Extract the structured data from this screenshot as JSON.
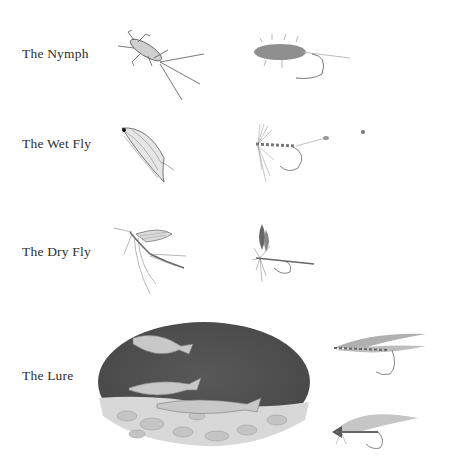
{
  "rows": [
    {
      "label": "The Nymph",
      "insect": "nymph-insect-illustration",
      "fly": "nymph-fly-illustration"
    },
    {
      "label": "The Wet Fly",
      "insect": "wet-fly-insect-illustration",
      "fly": "wet-fly-illustration"
    },
    {
      "label": "The Dry Fly",
      "insect": "mayfly-illustration",
      "fly": "dry-fly-illustration"
    },
    {
      "label": "The Lure",
      "insect": "underwater-fish-scene",
      "fly": "streamer-flies-illustration"
    }
  ],
  "colors": {
    "ink": "#2e2e2e",
    "water": "#4a4a4a",
    "background": "#ffffff"
  }
}
